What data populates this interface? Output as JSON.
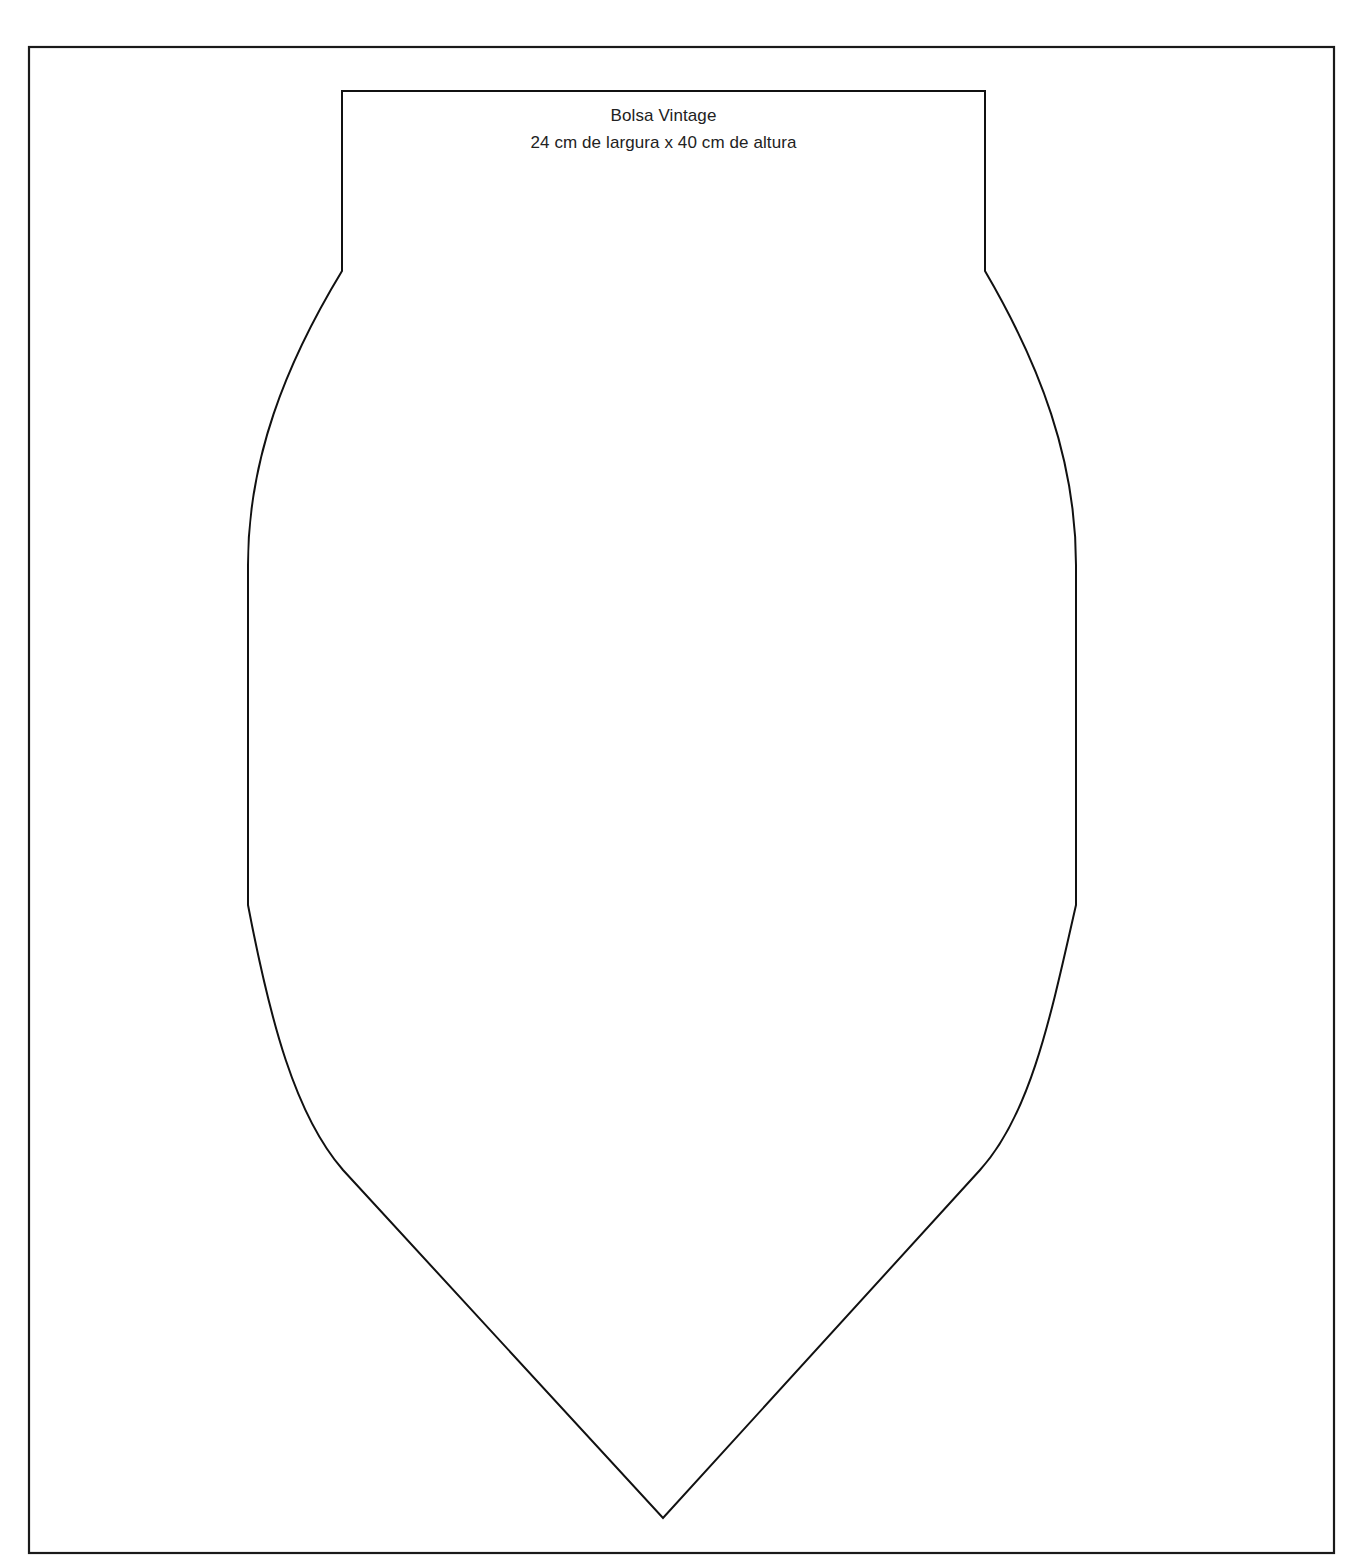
{
  "document": {
    "type": "sewing-pattern",
    "title": "Bolsa Vintage",
    "dimensions_label": "24 cm de largura x 40 cm de altura",
    "dimensions": {
      "width_cm": 24,
      "height_cm": 40
    }
  },
  "colors": {
    "line": "#111111",
    "background": "#ffffff",
    "text": "#222222"
  }
}
